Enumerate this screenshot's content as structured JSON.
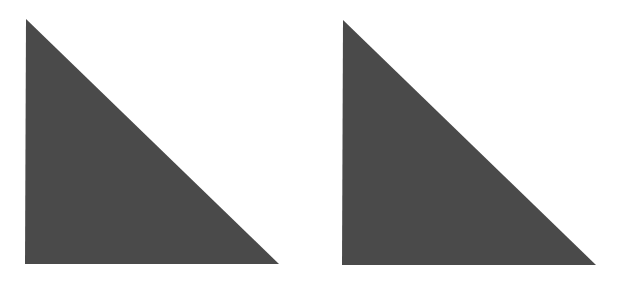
{
  "canvas": {
    "width": 620,
    "height": 282,
    "background": "#ffffff"
  },
  "shapes": [
    {
      "type": "right-triangle",
      "name": "left",
      "points": "26,19 25,264 279,264",
      "fill": "#4a4a4a"
    },
    {
      "type": "right-triangle",
      "name": "right",
      "points": "343,20 342,265 596,265",
      "fill": "#4a4a4a"
    }
  ]
}
